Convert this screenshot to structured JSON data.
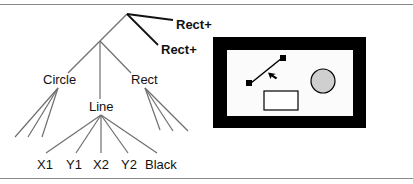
{
  "tree": {
    "root": {
      "x": 127,
      "y": 14
    },
    "edges_color": "#6e6e6e",
    "bold_edges_color": "#111111",
    "annotations": [
      {
        "label": "Rect+",
        "x": 176,
        "y": 29
      },
      {
        "label": "Rect+",
        "x": 161,
        "y": 54
      }
    ],
    "nodes": {
      "group": {
        "x": 100,
        "y": 41
      },
      "circle": {
        "label": "Circle",
        "x": 55,
        "y": 85
      },
      "rect": {
        "label": "Rect",
        "x": 145,
        "y": 85
      },
      "line": {
        "label": "Line",
        "x": 101,
        "y": 112
      }
    },
    "leaves": [
      {
        "label": "X1",
        "x": 45,
        "y": 165
      },
      {
        "label": "Y1",
        "x": 74,
        "y": 165
      },
      {
        "label": "X2",
        "x": 101,
        "y": 165
      },
      {
        "label": "Y2",
        "x": 129,
        "y": 165
      },
      {
        "label": "Black",
        "x": 161,
        "y": 165
      }
    ]
  },
  "canvas_preview": {
    "frame": {
      "x": 213,
      "y": 37,
      "w": 153,
      "h": 91,
      "thickness": 13,
      "color": "#000000"
    },
    "interior_color": "#fbfbfb",
    "shapes": {
      "line": {
        "x1": 249,
        "y1": 84,
        "x2": 283,
        "y2": 57
      },
      "circle": {
        "cx": 323,
        "cy": 81,
        "r": 12,
        "fill": "#cfcfcf"
      },
      "rect": {
        "x": 264,
        "y": 91,
        "w": 34,
        "h": 19
      }
    }
  }
}
